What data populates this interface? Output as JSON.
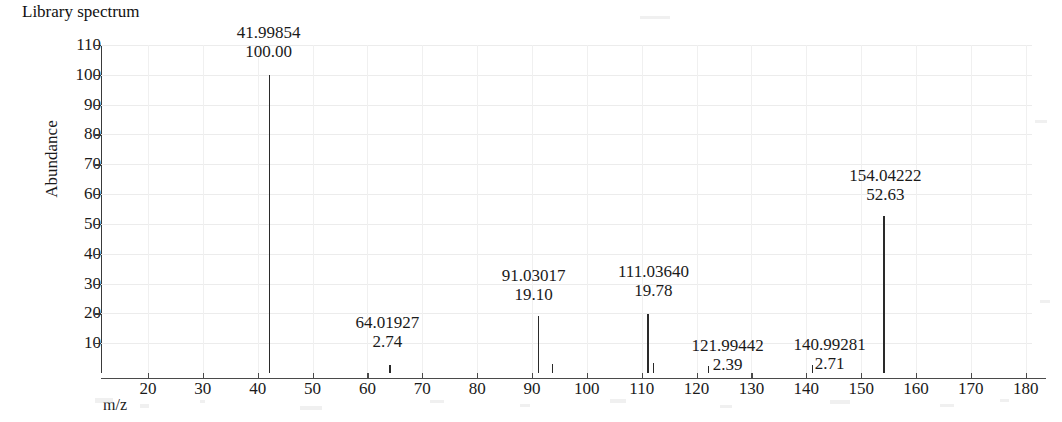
{
  "chart_title": "Library spectrum",
  "axes": {
    "y_title": "Abundance",
    "x_title": "m/z",
    "y_ticks": [
      110,
      100,
      90,
      80,
      70,
      60,
      50,
      40,
      30,
      20,
      10
    ],
    "x_ticks": [
      20,
      30,
      40,
      50,
      60,
      70,
      80,
      90,
      100,
      110,
      120,
      130,
      140,
      150,
      160,
      170,
      180
    ]
  },
  "chart_data": {
    "type": "bar",
    "title": "Library spectrum",
    "xlabel": "m/z",
    "ylabel": "Abundance",
    "xlim": [
      12,
      185
    ],
    "ylim": [
      0,
      113
    ],
    "grid": true,
    "legend": "none",
    "x": [
      41.99854,
      64.01927,
      91.03017,
      93.6,
      111.0364,
      112.0,
      121.99442,
      140.99281,
      154.04222
    ],
    "values": [
      100.0,
      2.74,
      19.1,
      3.1,
      19.78,
      3.4,
      2.39,
      2.71,
      52.63
    ],
    "labeled_peaks": [
      {
        "mz": "41.99854",
        "abundance": "100.00",
        "mz_value": 41.99854,
        "value": 100.0
      },
      {
        "mz": "64.01927",
        "abundance": "2.74",
        "mz_value": 64.01927,
        "value": 2.74
      },
      {
        "mz": "91.03017",
        "abundance": "19.10",
        "mz_value": 91.03017,
        "value": 19.1
      },
      {
        "mz": "111.03640",
        "abundance": "19.78",
        "mz_value": 111.0364,
        "value": 19.78
      },
      {
        "mz": "121.99442",
        "abundance": "2.39",
        "mz_value": 121.99442,
        "value": 2.39
      },
      {
        "mz": "140.99281",
        "abundance": "2.71",
        "mz_value": 140.99281,
        "value": 2.71
      },
      {
        "mz": "154.04222",
        "abundance": "52.63",
        "mz_value": 154.04222,
        "value": 52.63
      }
    ],
    "unlabeled_peaks": [
      {
        "mz_value": 93.6,
        "value": 3.1
      },
      {
        "mz_value": 112.0,
        "value": 3.4
      }
    ]
  },
  "peak_labels": [
    {
      "mz": "41.99854",
      "abundance": "100.00"
    },
    {
      "mz": "64.01927",
      "abundance": "2.74"
    },
    {
      "mz": "91.03017",
      "abundance": "19.10"
    },
    {
      "mz": "111.03640",
      "abundance": "19.78"
    },
    {
      "mz": "121.99442",
      "abundance": "2.39"
    },
    {
      "mz": "140.99281",
      "abundance": "2.71"
    },
    {
      "mz": "154.04222",
      "abundance": "52.63"
    }
  ],
  "colors": {
    "peak": "#2a2a2a",
    "axis": "#4a4a4a",
    "grid": "#ececec",
    "text": "#1a1a1a",
    "background": "#ffffff"
  }
}
